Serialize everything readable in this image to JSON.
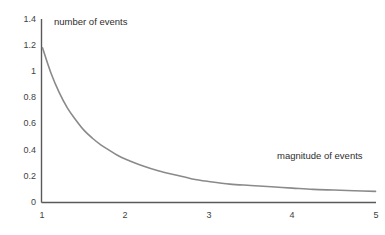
{
  "chart_data": {
    "type": "line",
    "title": "",
    "subtitle": "",
    "xlabel": "magnitude of events",
    "ylabel": "number of events",
    "xlim": [
      1,
      5
    ],
    "ylim": [
      0,
      1.4
    ],
    "grid": false,
    "legend": null,
    "x_ticks": [
      "1",
      "2",
      "3",
      "4",
      "5"
    ],
    "y_ticks": [
      "0",
      "0.2",
      "0.4",
      "0.6",
      "0.8",
      "1",
      "1.2",
      "1.4"
    ],
    "x_tick_values": [
      1,
      2,
      3,
      4,
      5
    ],
    "y_tick_values": [
      0,
      0.2,
      0.4,
      0.6,
      0.8,
      1,
      1.2,
      1.4
    ],
    "series": [
      {
        "name": "power-law decay",
        "color": "#8a8a8a",
        "x": [
          1.0,
          1.1,
          1.2,
          1.3,
          1.4,
          1.5,
          1.6,
          1.7,
          1.8,
          1.9,
          2.0,
          2.2,
          2.4,
          2.6,
          2.8,
          3.0,
          3.25,
          3.5,
          3.75,
          4.0,
          4.25,
          4.5,
          4.75,
          5.0
        ],
        "y": [
          1.18,
          0.99,
          0.84,
          0.72,
          0.63,
          0.55,
          0.49,
          0.44,
          0.4,
          0.36,
          0.33,
          0.28,
          0.24,
          0.21,
          0.18,
          0.16,
          0.14,
          0.13,
          0.12,
          0.11,
          0.1,
          0.095,
          0.09,
          0.085
        ]
      }
    ],
    "annotations": [
      {
        "text": "number of events",
        "x": 1.08,
        "y": 1.47
      },
      {
        "text": "magnitude of events",
        "x": 3.85,
        "y": 0.33
      }
    ]
  },
  "axes": {
    "y_axis_color": "#595959",
    "x_axis_color": "#595959",
    "curve_color": "#8a8a8a"
  }
}
